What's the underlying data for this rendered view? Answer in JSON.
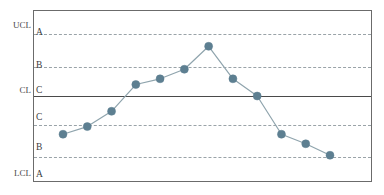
{
  "chart_data": {
    "type": "line",
    "title": "",
    "subtitle": "",
    "xlabel": "",
    "ylabel": "",
    "grid": true,
    "legend": "none",
    "chart_kind": "spc-control-chart-trend",
    "x": [
      1,
      2,
      3,
      4,
      5,
      6,
      7,
      8,
      9,
      10,
      11,
      12
    ],
    "values": [
      -2.0,
      -1.6,
      -0.8,
      0.6,
      0.9,
      1.4,
      2.6,
      0.9,
      0.0,
      -2.0,
      -2.5,
      -3.1
    ],
    "series": [
      {
        "name": "Measurement",
        "values": [
          -2.0,
          -1.6,
          -0.8,
          0.6,
          0.9,
          1.4,
          2.6,
          0.9,
          0.0,
          -2.0,
          -2.5,
          -3.1
        ]
      }
    ],
    "ylim": [
      -4.5,
      4.5
    ],
    "control_limits": {
      "UCL": 4.5,
      "CL": 0.0,
      "LCL": -4.5
    },
    "zone_boundaries": [
      3.0,
      1.5,
      0.0,
      -1.5,
      -3.0
    ],
    "zone_labels_upper": [
      "A",
      "B",
      "C"
    ],
    "zone_labels_lower": [
      "C",
      "B",
      "A"
    ],
    "annotations": []
  },
  "axis": {
    "upper_limit_label": "UCL",
    "center_label": "CL",
    "lower_limit_label": "LCL"
  },
  "zones": {
    "upper_a": "A",
    "upper_b": "B",
    "upper_c": "C",
    "lower_c": "C",
    "lower_b": "B",
    "lower_a": "A"
  },
  "style": {
    "marker_color": "#5d7f91",
    "line_color": "#8fa4ad",
    "zone_line_color": "#9aa3a8",
    "center_line_color": "#4a4a4a",
    "frame_color": "#6b6b6b",
    "background": "#ffffff",
    "text_color": "#3d3d3d"
  }
}
